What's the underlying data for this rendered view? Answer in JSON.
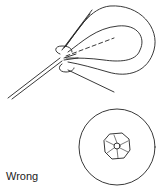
{
  "figure": {
    "caption": "Wrong",
    "views": [
      {
        "name": "side-view",
        "description": "loop of cord / leaf wrapped around a line, twisted incorrectly"
      },
      {
        "name": "cross-section",
        "description": "outer circle with inner octagonal bundle and central hole"
      }
    ],
    "colors": {
      "stroke": "#222222",
      "background": "#ffffff"
    }
  }
}
